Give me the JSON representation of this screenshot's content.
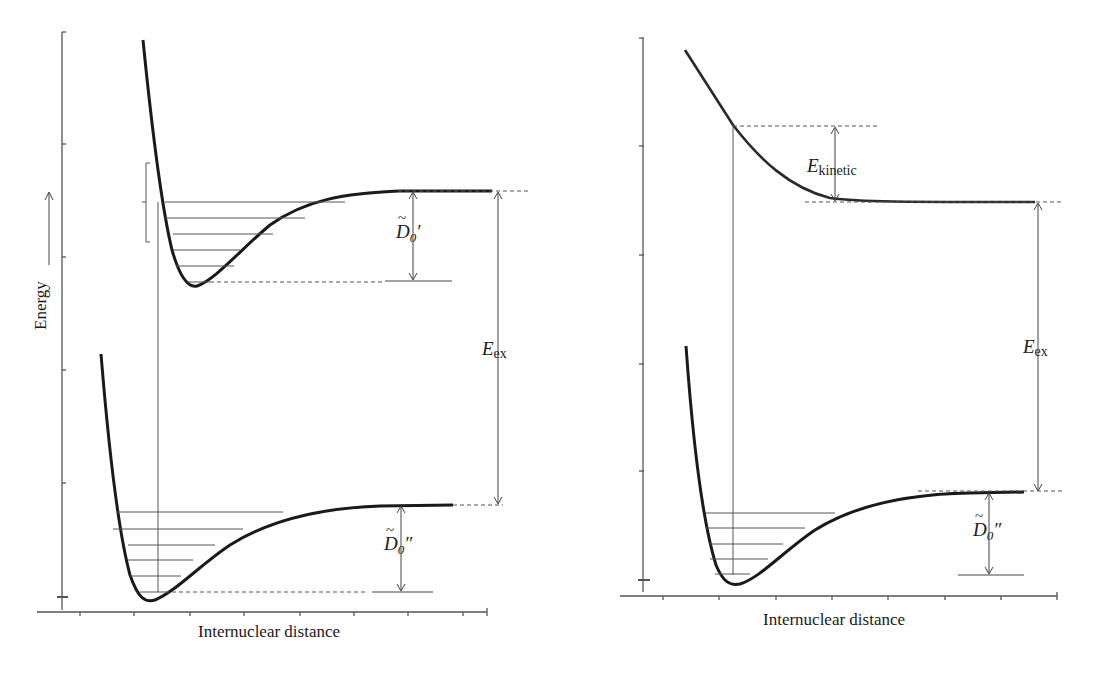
{
  "left_panel": {
    "y_axis_label": "Energy",
    "x_axis_label": "Internuclear distance",
    "upper_state_dissociation_label": "D",
    "upper_state_dissociation_sub": "0",
    "upper_state_prime": "′",
    "excitation_label": "E",
    "excitation_sub": "ex",
    "lower_state_dissociation_label": "D",
    "lower_state_dissociation_sub": "0",
    "lower_state_prime": "″",
    "tilde": "~"
  },
  "right_panel": {
    "x_axis_label": "Internuclear distance",
    "kinetic_label": "E",
    "kinetic_sub": "kinetic",
    "excitation_label": "E",
    "excitation_sub": "ex",
    "lower_state_dissociation_label": "D",
    "lower_state_dissociation_sub": "0",
    "lower_state_prime": "″",
    "tilde": "~"
  },
  "colors": {
    "curve": "#1a1a1a",
    "line": "#444444",
    "axis": "#555555"
  }
}
